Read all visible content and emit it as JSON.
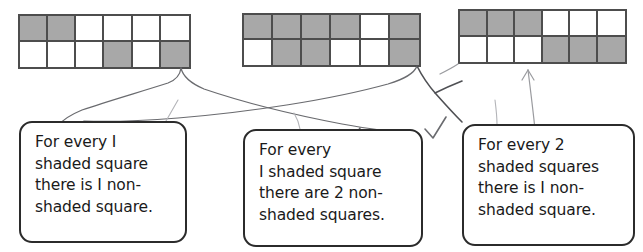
{
  "page": {
    "background_color": "#ffffff",
    "shaded_color": "#a8a8a8",
    "grid_line_color": "#4d4d4d",
    "box_border_color": "#2b2b2b",
    "ink_color": "#55565a",
    "text_color": "#1a1a1a"
  },
  "grids": [
    {
      "id": "grid-1",
      "columns": 6,
      "rows": 2,
      "shaded_count": 4,
      "plain_count": 8,
      "ratio_label": "1 shaded : 2 non-shaded",
      "cells": [
        [
          "shaded",
          "shaded",
          "plain",
          "plain",
          "plain",
          "plain"
        ],
        [
          "plain",
          "plain",
          "plain",
          "shaded",
          "plain",
          "shaded"
        ]
      ]
    },
    {
      "id": "grid-2",
      "columns": 6,
      "rows": 2,
      "shaded_count": 8,
      "plain_count": 4,
      "ratio_label": "2 shaded : 1 non-shaded",
      "cells": [
        [
          "shaded",
          "shaded",
          "shaded",
          "shaded",
          "plain",
          "shaded"
        ],
        [
          "plain",
          "shaded",
          "shaded",
          "plain",
          "plain",
          "shaded"
        ]
      ]
    },
    {
      "id": "grid-3",
      "columns": 6,
      "rows": 2,
      "shaded_count": 6,
      "plain_count": 6,
      "ratio_label": "1 shaded : 1 non-shaded",
      "cells": [
        [
          "shaded",
          "shaded",
          "shaded",
          "plain",
          "plain",
          "plain"
        ],
        [
          "plain",
          "plain",
          "plain",
          "shaded",
          "shaded",
          "shaded"
        ]
      ]
    }
  ],
  "boxes": [
    {
      "id": "box-1",
      "lines": [
        "For every I",
        "shaded square",
        "there is I non-",
        "shaded square."
      ]
    },
    {
      "id": "box-2",
      "lines": [
        "For every",
        "I shaded square",
        "there are 2 non-",
        "shaded squares."
      ]
    },
    {
      "id": "box-3",
      "lines": [
        "For every 2",
        "shaded squares",
        "there is I non-",
        "shaded square."
      ]
    }
  ],
  "marks": [
    {
      "id": "check-1",
      "type": "check-mark",
      "near": "box-2 first line"
    },
    {
      "id": "check-2",
      "type": "check-mark",
      "near": "between box-2 and box-3"
    }
  ],
  "connectors": [
    {
      "id": "connector-grid1-to-box2",
      "from": "grid-1",
      "to": "box-2"
    },
    {
      "id": "connector-grid2-to-box1",
      "from": "grid-2",
      "to": "box-1"
    },
    {
      "id": "connector-grid2-to-box3",
      "from": "grid-2",
      "to": "box-3"
    },
    {
      "id": "connector-grid3-to-box3",
      "from": "grid-3",
      "to": "box-3"
    }
  ]
}
